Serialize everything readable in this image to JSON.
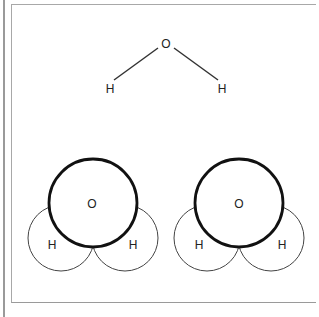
{
  "diagram": {
    "title": "",
    "structural_formula": {
      "center_atom": "O",
      "left_atom": "H",
      "right_atom": "H"
    },
    "space_filling_models": [
      {
        "center_atom": "O",
        "left_atom": "H",
        "right_atom": "H"
      },
      {
        "center_atom": "O",
        "left_atom": "H",
        "right_atom": "H"
      }
    ]
  }
}
